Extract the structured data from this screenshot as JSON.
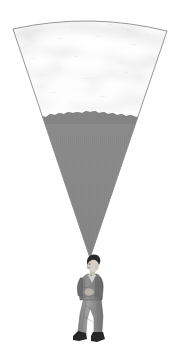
{
  "illustration": {
    "title": "Man looking up into a widening cone of sky and landscape",
    "caption": "",
    "background_color": "#ffffff",
    "canvas": {
      "width": 180,
      "height": 358
    }
  },
  "cone": {
    "name": "field-of-view-wedge",
    "apex": {
      "x": 90,
      "y": 258
    },
    "top_left": {
      "x": 13,
      "y": 29
    },
    "top_right": {
      "x": 167,
      "y": 31
    },
    "arc_peak": {
      "x": 90,
      "y": 15
    },
    "outline_color": "#8a8a8a",
    "outline_width": 0.9
  },
  "sky": {
    "name": "cloudy-sky-region",
    "base_color": "#fbfbfb",
    "cloud_light": "#ffffff",
    "cloud_mid": "#ededed",
    "cloud_dark": "#dcdcdc",
    "horizon_y": 115
  },
  "ground": {
    "name": "dark-landscape-region",
    "fill_color": "#8b8b8b",
    "fill_color_shaded": "#828282",
    "ridge_top_y": 112,
    "ridge_bottom_y": 124
  },
  "figure": {
    "name": "standing-man",
    "hair_color": "#2a2a2a",
    "skin_color": "#d8d2cb",
    "jacket_color": "#8d8d8d",
    "jacket_shadow": "#5f5f5f",
    "trouser_color": "#9a9a9a",
    "trouser_shadow": "#6c6c6c",
    "shoe_color": "#262626",
    "shirt_color": "#cfcfcf",
    "head_center": {
      "x": 94,
      "y": 266
    },
    "feet_y": 342,
    "height_px": 84
  }
}
